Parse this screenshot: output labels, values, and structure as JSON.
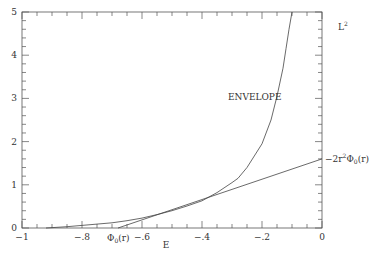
{
  "chart_data": {
    "type": "line",
    "title": "",
    "xlabel": "E",
    "ylabel": "L²",
    "xlim": [
      -1,
      0
    ],
    "ylim": [
      0,
      5
    ],
    "grid": false,
    "x_ticks": [
      -1,
      -0.8,
      -0.6,
      -0.4,
      -0.2,
      0
    ],
    "x_tick_labels": [
      "−1",
      "−.8",
      "",
      "−.4",
      "−.2",
      "0"
    ],
    "x_tick_label_minus6": "−.6",
    "y_ticks": [
      0,
      1,
      2,
      3,
      4,
      5
    ],
    "y_tick_labels": [
      "0",
      "1",
      "2",
      "3",
      "4",
      "5"
    ],
    "series": [
      {
        "name": "ENVELOPE",
        "x": [
          -0.92,
          -0.85,
          -0.8,
          -0.75,
          -0.7,
          -0.65,
          -0.6,
          -0.55,
          -0.5,
          -0.45,
          -0.4,
          -0.35,
          -0.3,
          -0.28,
          -0.25,
          -0.2,
          -0.17,
          -0.15,
          -0.13,
          -0.12,
          -0.11,
          -0.1
        ],
        "y": [
          0.0,
          0.03,
          0.06,
          0.09,
          0.12,
          0.17,
          0.23,
          0.31,
          0.4,
          0.51,
          0.63,
          0.82,
          1.05,
          1.15,
          1.4,
          1.95,
          2.5,
          3.05,
          3.7,
          4.15,
          4.6,
          5.0
        ]
      },
      {
        "name": "-2r²Φ₀(r)",
        "x": [
          -0.68,
          0.0
        ],
        "y": [
          0.0,
          1.6
        ]
      }
    ],
    "annotations": [
      {
        "text": "ENVELOPE",
        "x": -0.32,
        "y": 3.1
      },
      {
        "text": "Φ₀(r)",
        "x": -0.68,
        "y": -0.1
      },
      {
        "text": "−2r²Φ₀(r)",
        "x": 0.0,
        "y": 1.6
      },
      {
        "text": "L²",
        "x": 0.06,
        "y": 4.6
      }
    ]
  },
  "labels": {
    "xlabel": "E",
    "ylabel": "L",
    "ylabel_sup": "2",
    "envelope": "ENVELOPE",
    "phi_label": "Φ",
    "phi_sub": "0",
    "phi_arg": "(r)",
    "line_label_prefix": "−2r",
    "line_label_sup": "2",
    "line_label_phi": "Φ",
    "line_label_sub": "0",
    "line_label_arg": "(r)"
  }
}
